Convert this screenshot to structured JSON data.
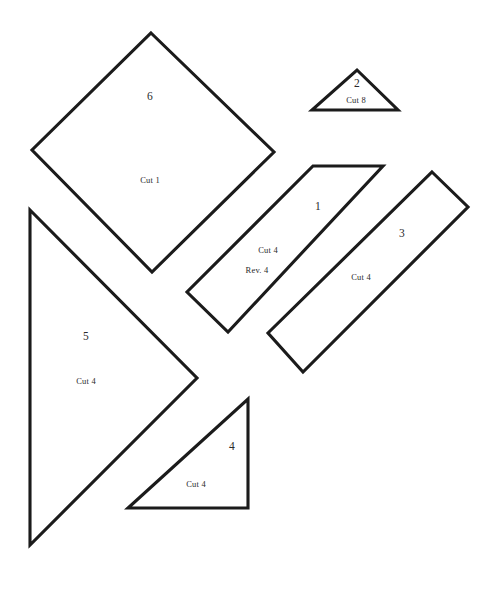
{
  "sheet": {
    "width": 495,
    "height": 589,
    "background_color": "#ffffff",
    "ink_color": "#1b1b1b",
    "text_color": "#2a2a2a",
    "title": "Pattern Template Sheet"
  },
  "pieces": [
    {
      "id": "piece-6",
      "shape": "diamond",
      "number": "6",
      "cut": "Cut 1",
      "reverse": null,
      "points": "151,33 274,152 152,272 32,150",
      "number_pos": {
        "x": 150,
        "y": 96
      },
      "cut_pos": {
        "x": 150,
        "y": 180
      },
      "reverse_pos": null
    },
    {
      "id": "piece-2",
      "shape": "triangle",
      "number": "2",
      "cut": "Cut 8",
      "reverse": null,
      "points": "357,70 398,110 312,110",
      "number_pos": {
        "x": 357,
        "y": 83
      },
      "cut_pos": {
        "x": 356,
        "y": 100
      },
      "reverse_pos": null
    },
    {
      "id": "piece-1",
      "shape": "parallelogram",
      "number": "1",
      "cut": "Cut 4",
      "reverse": "Rev. 4",
      "points": "313,166 383,166 228,332 187,292",
      "number_pos": {
        "x": 318,
        "y": 206
      },
      "cut_pos": {
        "x": 268,
        "y": 250
      },
      "reverse_pos": {
        "x": 257,
        "y": 270
      }
    },
    {
      "id": "piece-3",
      "shape": "parallelogram",
      "number": "3",
      "cut": "Cut 4",
      "reverse": null,
      "points": "432,172 468,207 303,372 268,333",
      "number_pos": {
        "x": 402,
        "y": 233
      },
      "cut_pos": {
        "x": 361,
        "y": 277
      },
      "reverse_pos": null
    },
    {
      "id": "piece-5",
      "shape": "triangle",
      "number": "5",
      "cut": "Cut 4",
      "reverse": null,
      "points": "30,210 197,378 30,545",
      "number_pos": {
        "x": 86,
        "y": 336
      },
      "cut_pos": {
        "x": 86,
        "y": 381
      },
      "reverse_pos": null
    },
    {
      "id": "piece-4",
      "shape": "right-triangle",
      "number": "4",
      "cut": "Cut 4",
      "reverse": null,
      "points": "248,399 248,508 128,508",
      "number_pos": {
        "x": 232,
        "y": 446
      },
      "cut_pos": {
        "x": 196,
        "y": 484
      },
      "reverse_pos": null
    }
  ]
}
